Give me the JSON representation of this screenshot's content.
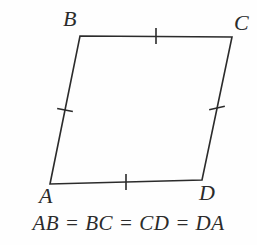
{
  "figure": {
    "name": "rhombus-abcd",
    "background_color": "#fefefe",
    "stroke_color": "#2b2b2b",
    "stroke_width": 1.6,
    "vertices": [
      {
        "id": "A",
        "label": "A",
        "x": 50,
        "y": 184
      },
      {
        "id": "B",
        "label": "B",
        "x": 80,
        "y": 36
      },
      {
        "id": "C",
        "label": "C",
        "x": 232,
        "y": 37
      },
      {
        "id": "D",
        "label": "D",
        "x": 202,
        "y": 180
      }
    ],
    "sides": [
      {
        "id": "AB",
        "from": "A",
        "to": "B",
        "tick_count": 1
      },
      {
        "id": "BC",
        "from": "B",
        "to": "C",
        "tick_count": 1
      },
      {
        "id": "CD",
        "from": "C",
        "to": "D",
        "tick_count": 1
      },
      {
        "id": "DA",
        "from": "D",
        "to": "A",
        "tick_count": 1
      }
    ],
    "tick_marks": [
      {
        "side": "AB",
        "cx": 65,
        "cy": 110,
        "angle_deg": 11,
        "length": 16
      },
      {
        "side": "BC",
        "cx": 156,
        "cy": 36,
        "angle_deg": 90,
        "length": 16
      },
      {
        "side": "CD",
        "cx": 217,
        "cy": 108,
        "angle_deg": -12,
        "length": 16
      },
      {
        "side": "DA",
        "cx": 126,
        "cy": 182,
        "angle_deg": 90,
        "length": 16
      }
    ],
    "caption": "AB = BC = CD = DA"
  }
}
